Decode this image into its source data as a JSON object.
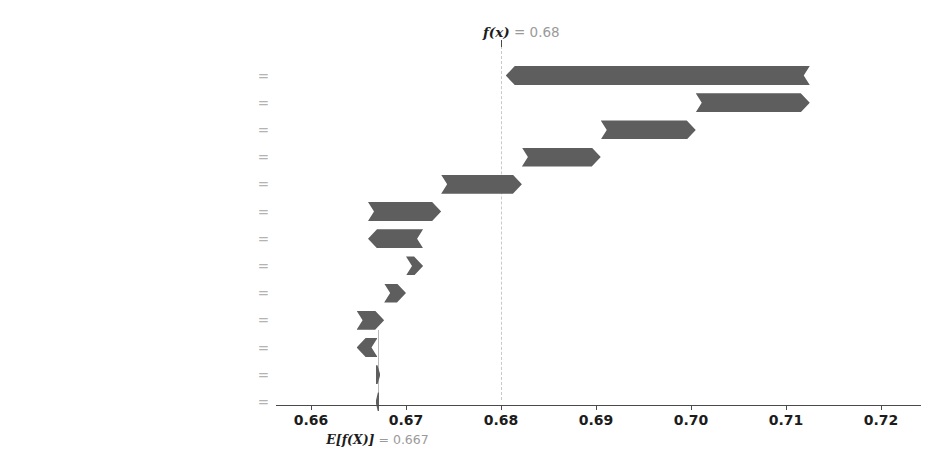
{
  "chart_data": {
    "type": "bar",
    "subtype": "shap-waterfall",
    "title": "",
    "xlabel": "",
    "ylabel": "",
    "base_value": 0.667,
    "base_value_label": "0.667",
    "base_value_prefix": "E[f(X)]",
    "base_value_eq": " = ",
    "output_value": 0.68,
    "output_value_label": "0.68",
    "output_value_prefix": "f(x)",
    "output_value_eq": " = ",
    "xlim": [
      0.6545,
      0.7225
    ],
    "xticks": [
      0.66,
      0.67,
      0.68,
      0.69,
      0.7,
      0.71,
      0.72
    ],
    "xticklabels": [
      "0.66",
      "0.67",
      "0.68",
      "0.69",
      "0.70",
      "0.71",
      "0.72"
    ],
    "grid": false,
    "legend": false,
    "bar_color": "#5e5e5e",
    "features": [
      {
        "name": "Serum Creatinine",
        "value": "1.24",
        "shap": -0.03,
        "label": "−0.03",
        "start": 0.7125,
        "end": 0.6805,
        "direction": "neg",
        "label_pos": "inside"
      },
      {
        "name": "Age",
        "value": "17",
        "shap": 0.01,
        "label": "+0.01",
        "start": 0.7005,
        "end": 0.7125,
        "direction": "pos",
        "label_pos": "inside"
      },
      {
        "name": "Follow-Up Time",
        "value": "24",
        "shap": 0.01,
        "label": "+0.01",
        "start": 0.6905,
        "end": 0.7005,
        "direction": "pos",
        "label_pos": "inside"
      },
      {
        "name": "Ejection Fraction",
        "value": "68",
        "shap": 0.01,
        "label": "+0.01",
        "start": 0.6822,
        "end": 0.6905,
        "direction": "pos",
        "label_pos": "inside"
      },
      {
        "name": "Platelates",
        "value": "260",
        "shap": 0.01,
        "label": "+0.01",
        "start": 0.6737,
        "end": 0.6822,
        "direction": "pos",
        "label_pos": "inside"
      },
      {
        "name": "Serum Sodium",
        "value": "127",
        "shap": 0.01,
        "label": "+0.01",
        "start": 0.666,
        "end": 0.6737,
        "direction": "pos",
        "label_pos": "inside"
      },
      {
        "name": "Diabetes",
        "value": "0",
        "shap": -0.01,
        "label": "−0.01",
        "start": 0.6718,
        "end": 0.666,
        "direction": "neg",
        "label_pos": "inside"
      },
      {
        "name": "Anemia",
        "value": "0",
        "shap": 0.0,
        "label": "+0",
        "start": 0.67,
        "end": 0.6718,
        "direction": "pos",
        "label_pos": "inside"
      },
      {
        "name": "Blood Preasure",
        "value": "0",
        "shap": 0.0,
        "label": "+0",
        "start": 0.6677,
        "end": 0.67,
        "direction": "pos",
        "label_pos": "inside"
      },
      {
        "name": "Gender",
        "value": "0",
        "shap": 0.0,
        "label": "+0",
        "start": 0.6648,
        "end": 0.6677,
        "direction": "pos",
        "label_pos": "inside"
      },
      {
        "name": "Blood Type",
        "value": "2",
        "shap": -0.0,
        "label": "−0",
        "start": 0.667,
        "end": 0.6648,
        "direction": "neg",
        "label_pos": "left"
      },
      {
        "name": "Smoking",
        "value": "0",
        "shap": 0.0,
        "label": "+0",
        "start": 0.6668,
        "end": 0.6673,
        "direction": "pos",
        "label_pos": "right"
      },
      {
        "name": "Physical Environment",
        "value": "4",
        "shap": -0.0,
        "label": "−0",
        "start": 0.6672,
        "end": 0.6668,
        "direction": "neg",
        "label_pos": "left"
      }
    ]
  }
}
